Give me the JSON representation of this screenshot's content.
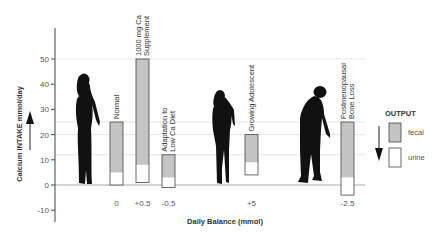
{
  "chart_data": {
    "type": "bar",
    "stacked": true,
    "title": "",
    "ylabel": "Calcium INTAKE  mmol/day",
    "xlabel": "Daily Balance (mmol)",
    "ylim": [
      -15,
      60
    ],
    "yticks": [
      -10,
      0,
      10,
      20,
      30,
      40,
      50
    ],
    "grid": false,
    "reference_lines": [
      50,
      25,
      20,
      12
    ],
    "categories": [
      "Normal",
      "1000 mg Ca Supplement",
      "Adaptation to Low Ca Diet",
      "Growing Adolescent",
      "Postmenopausal Bone Loss"
    ],
    "category_lines": [
      [
        "Normal"
      ],
      [
        "1000 mg Ca",
        "Supplement"
      ],
      [
        "Adaptation to",
        "Low Ca Diet"
      ],
      [
        "Growing Adolescent"
      ],
      [
        "Postmenopausal",
        "Bone Loss"
      ]
    ],
    "balance_labels": [
      "0",
      "+0.5",
      "-0.5",
      "+5",
      "-2.5"
    ],
    "bars": [
      {
        "bottom": 0,
        "urine_top": 5,
        "top": 25
      },
      {
        "bottom": 1,
        "urine_top": 8,
        "top": 50
      },
      {
        "bottom": -1,
        "urine_top": 3,
        "top": 12
      },
      {
        "bottom": 4,
        "urine_top": 9,
        "top": 20
      },
      {
        "bottom": -4,
        "urine_top": 3,
        "top": 25
      }
    ],
    "series": [
      {
        "name": "urine",
        "color": "#ffffff"
      },
      {
        "name": "fecal",
        "color": "#c4c4c4"
      }
    ],
    "legend": {
      "title": "OUTPUT",
      "items": [
        {
          "label": "fecal",
          "color": "#c4c4c4"
        },
        {
          "label": "urine",
          "color": "#ffffff"
        }
      ],
      "placement": "right"
    },
    "silhouettes": [
      "standing-woman",
      "teenage-girl",
      "stooped-elderly-person"
    ]
  }
}
